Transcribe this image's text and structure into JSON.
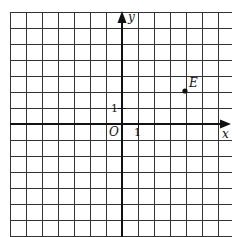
{
  "diagram": {
    "type": "coordinate-grid",
    "grid": {
      "columns": 14,
      "rows": 14,
      "unit": 1
    },
    "x_axis_label": "x",
    "y_axis_label": "y",
    "origin_label": "O",
    "x_tick_label": "1",
    "y_tick_label": "1",
    "points": [
      {
        "label": "E",
        "x": 4,
        "y": 2
      }
    ]
  }
}
